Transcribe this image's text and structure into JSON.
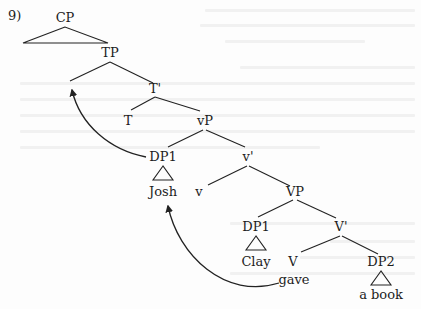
{
  "example_number": "9)",
  "tree": {
    "nodes": {
      "cp": "CP",
      "tp": "TP",
      "t_bar": "T'",
      "t": "T",
      "vp_little": "vP",
      "dp1_spec_vp": "DP1",
      "josh": "Josh",
      "v_bar_little": "v'",
      "v_little": "v",
      "vp_big": "VP",
      "dp1_spec_VP": "DP1",
      "clay": "Clay",
      "v_bar_big": "V'",
      "v_big": "V",
      "gave": "gave",
      "dp2": "DP2",
      "a_book": "a book"
    },
    "movements": [
      {
        "from": "DP1 (spec vP)",
        "to": "spec TP",
        "label": "subject raising"
      },
      {
        "from": "gave (V)",
        "to": "Josh (DP1 spec vP)",
        "label": "curved arrow"
      }
    ]
  },
  "colors": {
    "ink": "#1c1c1c",
    "paper": "#fdfdfd",
    "bleed_through": "#f1f1f1"
  }
}
